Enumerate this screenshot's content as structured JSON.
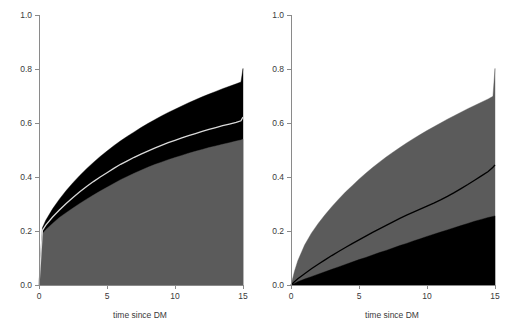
{
  "figure": {
    "kind": "two-panel-stacked-cumulative-incidence",
    "background": "#ffffff",
    "colors": {
      "gray_band": "#5b5b5b",
      "black_band": "#000000",
      "light_line": "#d9d9d9",
      "dark_line": "#000000",
      "axis": "#8a8a8a",
      "text": "#3a3a3a"
    }
  },
  "chart_data": [
    {
      "panel": "left",
      "type": "area",
      "title": "",
      "xlabel": "time since DM",
      "ylabel": "",
      "xlim": [
        0,
        15
      ],
      "ylim": [
        0,
        1
      ],
      "xticks": [
        0,
        5,
        10,
        15
      ],
      "xticklabels": [
        "0",
        "5",
        "10",
        "15"
      ],
      "yticks": [
        0,
        0.2,
        0.4,
        0.6,
        0.8,
        1.0
      ],
      "yticklabels": [
        "0.0",
        "0.2",
        "0.4",
        "0.6",
        "0.8",
        "1.0"
      ],
      "grid": false,
      "legend": "none",
      "x": [
        0,
        0.25,
        0.5,
        1,
        1.5,
        2,
        2.5,
        3,
        3.5,
        4,
        4.5,
        5,
        5.5,
        6,
        6.5,
        7,
        7.5,
        8,
        8.5,
        9,
        9.5,
        10,
        10.5,
        11,
        11.5,
        12,
        12.5,
        13,
        13.5,
        14,
        14.5,
        14.85,
        15
      ],
      "series": [
        {
          "name": "lower gray region upper boundary",
          "fill": "#5b5b5b",
          "values": [
            0.0,
            0.19,
            0.205,
            0.228,
            0.25,
            0.268,
            0.285,
            0.302,
            0.318,
            0.333,
            0.348,
            0.362,
            0.376,
            0.39,
            0.402,
            0.414,
            0.425,
            0.436,
            0.446,
            0.455,
            0.464,
            0.472,
            0.48,
            0.488,
            0.495,
            0.502,
            0.509,
            0.515,
            0.521,
            0.527,
            0.533,
            0.537,
            0.54
          ]
        },
        {
          "name": "light center line",
          "stroke": "#d9d9d9",
          "values": [
            0.0,
            0.202,
            0.222,
            0.252,
            0.278,
            0.302,
            0.324,
            0.345,
            0.365,
            0.383,
            0.4,
            0.416,
            0.432,
            0.447,
            0.46,
            0.473,
            0.485,
            0.496,
            0.507,
            0.517,
            0.527,
            0.536,
            0.545,
            0.553,
            0.561,
            0.569,
            0.576,
            0.583,
            0.59,
            0.596,
            0.602,
            0.608,
            0.622
          ]
        },
        {
          "name": "upper black band top boundary",
          "fill": "#000000",
          "values": [
            0.0,
            0.212,
            0.24,
            0.282,
            0.318,
            0.35,
            0.379,
            0.406,
            0.431,
            0.454,
            0.476,
            0.496,
            0.516,
            0.534,
            0.551,
            0.567,
            0.583,
            0.598,
            0.612,
            0.626,
            0.639,
            0.651,
            0.663,
            0.675,
            0.686,
            0.697,
            0.707,
            0.717,
            0.727,
            0.736,
            0.745,
            0.752,
            0.802
          ]
        }
      ]
    },
    {
      "panel": "right",
      "type": "area",
      "title": "",
      "xlabel": "time since DM",
      "ylabel": "",
      "xlim": [
        0,
        15
      ],
      "ylim": [
        0,
        1
      ],
      "xticks": [
        0,
        5,
        10,
        15
      ],
      "xticklabels": [
        "0",
        "5",
        "10",
        "15"
      ],
      "yticks": [
        0,
        0.2,
        0.4,
        0.6,
        0.8,
        1.0
      ],
      "yticklabels": [
        "0.0",
        "0.2",
        "0.4",
        "0.6",
        "0.8",
        "1.0"
      ],
      "grid": false,
      "legend": "none",
      "x": [
        0,
        0.25,
        0.5,
        1,
        1.5,
        2,
        2.5,
        3,
        3.5,
        4,
        4.5,
        5,
        5.5,
        6,
        6.5,
        7,
        7.5,
        8,
        8.5,
        9,
        9.5,
        10,
        10.5,
        11,
        11.5,
        12,
        12.5,
        13,
        13.5,
        14,
        14.5,
        14.85,
        15
      ],
      "series": [
        {
          "name": "lower black region upper boundary",
          "fill": "#000000",
          "values": [
            0.0,
            0.006,
            0.012,
            0.022,
            0.031,
            0.04,
            0.049,
            0.058,
            0.067,
            0.076,
            0.085,
            0.094,
            0.102,
            0.111,
            0.12,
            0.128,
            0.137,
            0.146,
            0.154,
            0.163,
            0.171,
            0.18,
            0.188,
            0.196,
            0.204,
            0.212,
            0.22,
            0.228,
            0.236,
            0.243,
            0.25,
            0.254,
            0.256
          ]
        },
        {
          "name": "dark center line",
          "stroke": "#000000",
          "values": [
            0.0,
            0.012,
            0.023,
            0.042,
            0.06,
            0.077,
            0.093,
            0.109,
            0.124,
            0.139,
            0.153,
            0.167,
            0.181,
            0.195,
            0.208,
            0.221,
            0.234,
            0.247,
            0.259,
            0.27,
            0.281,
            0.292,
            0.303,
            0.315,
            0.328,
            0.342,
            0.357,
            0.372,
            0.388,
            0.404,
            0.42,
            0.436,
            0.445
          ]
        },
        {
          "name": "upper gray region top boundary",
          "fill": "#5b5b5b",
          "values": [
            0.0,
            0.05,
            0.09,
            0.148,
            0.192,
            0.228,
            0.26,
            0.29,
            0.318,
            0.344,
            0.368,
            0.392,
            0.414,
            0.435,
            0.455,
            0.474,
            0.492,
            0.509,
            0.526,
            0.542,
            0.557,
            0.572,
            0.586,
            0.6,
            0.614,
            0.627,
            0.64,
            0.653,
            0.665,
            0.677,
            0.689,
            0.699,
            0.802
          ]
        }
      ]
    }
  ]
}
